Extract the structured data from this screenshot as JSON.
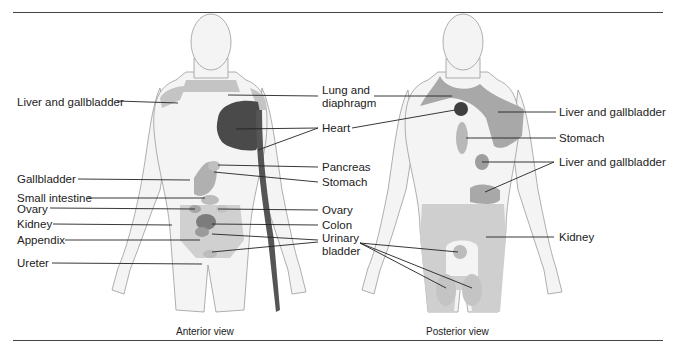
{
  "figure": {
    "anterior": {
      "caption": "Anterior view",
      "labels_left": [
        "Liver and gallbladder",
        "Gallbladder",
        "Small intestine",
        "Ovary",
        "Kidney",
        "Appendix",
        "Ureter"
      ],
      "labels_center": [
        "Lung and",
        "diaphragm",
        "Heart",
        "Pancreas",
        "Stomach",
        "Ovary",
        "Colon",
        "Urinary",
        "bladder"
      ]
    },
    "posterior": {
      "caption": "Posterior view",
      "labels_right": [
        "Liver and gallbladder",
        "Stomach",
        "Liver and gallbladder",
        "Kidney"
      ]
    }
  },
  "colors": {
    "body_outline": "#9a9a9a",
    "body_fill": "#f2f2f2",
    "region_light": "#c8c8c8",
    "region_mid": "#a8a8a8",
    "region_dark": "#555555",
    "region_darkest": "#3a3a3a",
    "rule": "#444444"
  }
}
